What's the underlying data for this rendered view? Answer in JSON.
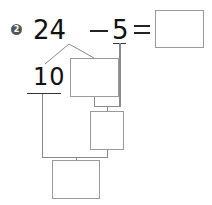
{
  "problem": {
    "number": "2",
    "minuend": "24",
    "minus": "−",
    "subtrahend": "5",
    "equals": "=",
    "answer": "",
    "split_known": "10",
    "split_unknown": "",
    "intermediate": "",
    "final": ""
  },
  "colors": {
    "badge": "#555555",
    "box_border": "#9a9a9a",
    "connector": "#8a8a8a",
    "text": "#111111"
  }
}
